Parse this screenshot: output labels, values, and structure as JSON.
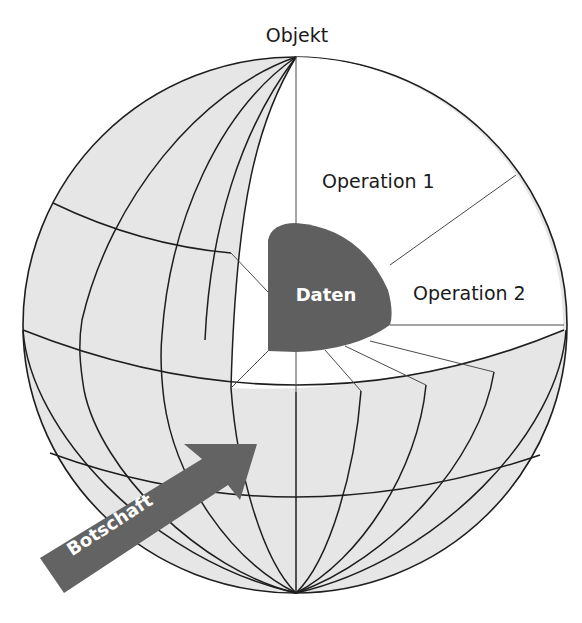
{
  "diagram": {
    "type": "object-sphere",
    "labels": {
      "object": "Objekt",
      "operation1": "Operation 1",
      "operation2": "Operation 2",
      "data": "Daten",
      "message": "Botschaft"
    },
    "colors": {
      "sphere_fill": "#e6e6e6",
      "cutout_fill": "#ffffff",
      "data_fill": "#5f5f5f",
      "arrow_fill": "#636363",
      "line": "#1e1e1e"
    }
  }
}
